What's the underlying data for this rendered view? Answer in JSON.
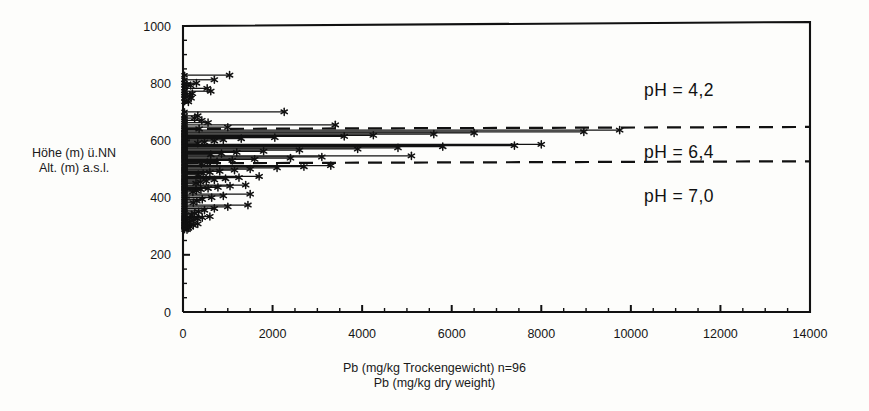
{
  "figure": {
    "background_color": "#fdfdfb",
    "ink_color": "#111111"
  },
  "axes": {
    "y_caption_line1": "Höhe (m) ü.NN",
    "y_caption_line2": "Alt. (m) a.s.l.",
    "x_caption_line1": "Pb (mg/kg Trockengewicht) n=96",
    "x_caption_line2": "Pb (mg/kg dry weight)"
  },
  "annotations": {
    "ph_zone_upper": "pH  = 4,2",
    "ph_zone_middle": "pH  = 6,4",
    "ph_zone_lower": "pH  = 7,0"
  },
  "chart_data": {
    "type": "scatter",
    "title": "",
    "subtitle": "",
    "xlabel": "Pb (mg/kg Trockengewicht) n=96 / Pb (mg/kg dry weight)",
    "ylabel": "Höhe (m) üNN / Alt. (m) a.s.l.",
    "xlim": [
      0,
      14000
    ],
    "ylim": [
      0,
      1000
    ],
    "x_major_ticks": [
      0,
      2000,
      4000,
      6000,
      8000,
      10000,
      12000,
      14000
    ],
    "x_minor_tick_step": 500,
    "y_major_ticks": [
      0,
      200,
      400,
      600,
      800,
      1000
    ],
    "y_minor_tick_step": 50,
    "grid": false,
    "legend": false,
    "n": 96,
    "marker": "star",
    "series_note": "Each sample drawn as a horizontal stem from x=0 to the measured Pb value at its altitude, terminated by a star marker.",
    "reference_lines": [
      {
        "name": "ph-boundary-upper",
        "y": 640,
        "style": "dashed"
      },
      {
        "name": "ph-boundary-lower",
        "y": 520,
        "style": "dashed"
      }
    ],
    "ph_zones": [
      {
        "label": "pH  = 4,2",
        "y_range": [
          640,
          1000
        ]
      },
      {
        "label": "pH  = 6,4",
        "y_range": [
          520,
          640
        ]
      },
      {
        "label": "pH  = 7,0",
        "y_range": [
          0,
          520
        ]
      }
    ],
    "points": [
      {
        "pb": 1040,
        "alt": 828
      },
      {
        "pb": 700,
        "alt": 812
      },
      {
        "pb": 300,
        "alt": 800
      },
      {
        "pb": 170,
        "alt": 792
      },
      {
        "pb": 540,
        "alt": 782
      },
      {
        "pb": 620,
        "alt": 772
      },
      {
        "pb": 210,
        "alt": 764
      },
      {
        "pb": 150,
        "alt": 756
      },
      {
        "pb": 180,
        "alt": 748
      },
      {
        "pb": 120,
        "alt": 735
      },
      {
        "pb": 2260,
        "alt": 700
      },
      {
        "pb": 330,
        "alt": 686
      },
      {
        "pb": 260,
        "alt": 678
      },
      {
        "pb": 420,
        "alt": 670
      },
      {
        "pb": 560,
        "alt": 662
      },
      {
        "pb": 3400,
        "alt": 654
      },
      {
        "pb": 1000,
        "alt": 646
      },
      {
        "pb": 360,
        "alt": 640
      },
      {
        "pb": 9750,
        "alt": 636
      },
      {
        "pb": 8950,
        "alt": 630
      },
      {
        "pb": 6500,
        "alt": 626
      },
      {
        "pb": 5600,
        "alt": 622
      },
      {
        "pb": 4250,
        "alt": 618
      },
      {
        "pb": 3600,
        "alt": 614
      },
      {
        "pb": 2050,
        "alt": 610
      },
      {
        "pb": 1300,
        "alt": 606
      },
      {
        "pb": 900,
        "alt": 602
      },
      {
        "pb": 700,
        "alt": 598
      },
      {
        "pb": 480,
        "alt": 594
      },
      {
        "pb": 330,
        "alt": 590
      },
      {
        "pb": 8000,
        "alt": 586
      },
      {
        "pb": 7400,
        "alt": 582
      },
      {
        "pb": 5800,
        "alt": 578
      },
      {
        "pb": 4800,
        "alt": 574
      },
      {
        "pb": 3900,
        "alt": 570
      },
      {
        "pb": 2600,
        "alt": 566
      },
      {
        "pb": 1800,
        "alt": 562
      },
      {
        "pb": 1200,
        "alt": 558
      },
      {
        "pb": 860,
        "alt": 554
      },
      {
        "pb": 620,
        "alt": 550
      },
      {
        "pb": 5100,
        "alt": 546
      },
      {
        "pb": 3100,
        "alt": 542
      },
      {
        "pb": 2400,
        "alt": 538
      },
      {
        "pb": 1600,
        "alt": 534
      },
      {
        "pb": 1100,
        "alt": 530
      },
      {
        "pb": 760,
        "alt": 526
      },
      {
        "pb": 540,
        "alt": 522
      },
      {
        "pb": 410,
        "alt": 518
      },
      {
        "pb": 3300,
        "alt": 512
      },
      {
        "pb": 2700,
        "alt": 508
      },
      {
        "pb": 2100,
        "alt": 504
      },
      {
        "pb": 1500,
        "alt": 500
      },
      {
        "pb": 1150,
        "alt": 496
      },
      {
        "pb": 820,
        "alt": 492
      },
      {
        "pb": 600,
        "alt": 488
      },
      {
        "pb": 450,
        "alt": 484
      },
      {
        "pb": 340,
        "alt": 480
      },
      {
        "pb": 1700,
        "alt": 474
      },
      {
        "pb": 1250,
        "alt": 470
      },
      {
        "pb": 950,
        "alt": 466
      },
      {
        "pb": 700,
        "alt": 462
      },
      {
        "pb": 520,
        "alt": 458
      },
      {
        "pb": 390,
        "alt": 454
      },
      {
        "pb": 290,
        "alt": 450
      },
      {
        "pb": 1400,
        "alt": 444
      },
      {
        "pb": 1050,
        "alt": 440
      },
      {
        "pb": 780,
        "alt": 436
      },
      {
        "pb": 560,
        "alt": 432
      },
      {
        "pb": 400,
        "alt": 428
      },
      {
        "pb": 300,
        "alt": 424
      },
      {
        "pb": 220,
        "alt": 420
      },
      {
        "pb": 1500,
        "alt": 412
      },
      {
        "pb": 900,
        "alt": 406
      },
      {
        "pb": 640,
        "alt": 400
      },
      {
        "pb": 430,
        "alt": 394
      },
      {
        "pb": 310,
        "alt": 388
      },
      {
        "pb": 230,
        "alt": 382
      },
      {
        "pb": 1450,
        "alt": 374
      },
      {
        "pb": 1000,
        "alt": 368
      },
      {
        "pb": 700,
        "alt": 362
      },
      {
        "pb": 480,
        "alt": 356
      },
      {
        "pb": 350,
        "alt": 350
      },
      {
        "pb": 260,
        "alt": 345
      },
      {
        "pb": 190,
        "alt": 340
      },
      {
        "pb": 600,
        "alt": 334
      },
      {
        "pb": 430,
        "alt": 330
      },
      {
        "pb": 320,
        "alt": 326
      },
      {
        "pb": 240,
        "alt": 322
      },
      {
        "pb": 180,
        "alt": 318
      },
      {
        "pb": 140,
        "alt": 314
      },
      {
        "pb": 330,
        "alt": 308
      },
      {
        "pb": 230,
        "alt": 303
      },
      {
        "pb": 160,
        "alt": 298
      },
      {
        "pb": 120,
        "alt": 293
      },
      {
        "pb": 90,
        "alt": 288
      },
      {
        "pb": 70,
        "alt": 300
      }
    ]
  }
}
